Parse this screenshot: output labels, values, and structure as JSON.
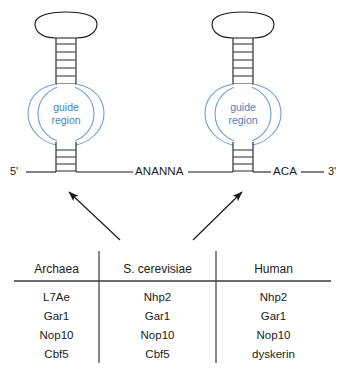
{
  "diagram": {
    "stem_loops": [
      {
        "name": "left-stem-loop",
        "guide_label_line1": "guide",
        "guide_label_line2": "region",
        "upper_stem_rungs": 6,
        "lower_stem_rungs": 4
      },
      {
        "name": "right-stem-loop",
        "guide_label_line1": "guide",
        "guide_label_line2": "region",
        "upper_stem_rungs": 6,
        "lower_stem_rungs": 4
      }
    ],
    "backbone": {
      "five_prime": "5'",
      "three_prime": "3'",
      "h_box": "ANANNA",
      "aca_box": "ACA"
    },
    "arrows": [
      {
        "name": "arrow-to-left-stem-loop",
        "direction": "up-left"
      },
      {
        "name": "arrow-to-right-stem-loop",
        "direction": "up-right"
      }
    ],
    "colors": {
      "guide_stroke": "#6e9fd4",
      "guide_text": "#4a7fbe",
      "line": "#1a1a1a",
      "rung": "#4d4d4d",
      "background": "#ffffff"
    }
  },
  "table": {
    "name": "core-protein-table",
    "columns": [
      "Archaea",
      "S. cerevisiae",
      "Human"
    ],
    "rows": [
      [
        "L7Ae",
        "Nhp2",
        "Nhp2"
      ],
      [
        "Gar1",
        "Gar1",
        "Gar1"
      ],
      [
        "Nop10",
        "Nop10",
        "Nop10"
      ],
      [
        "Cbf5",
        "Cbf5",
        "dyskerin"
      ]
    ]
  }
}
